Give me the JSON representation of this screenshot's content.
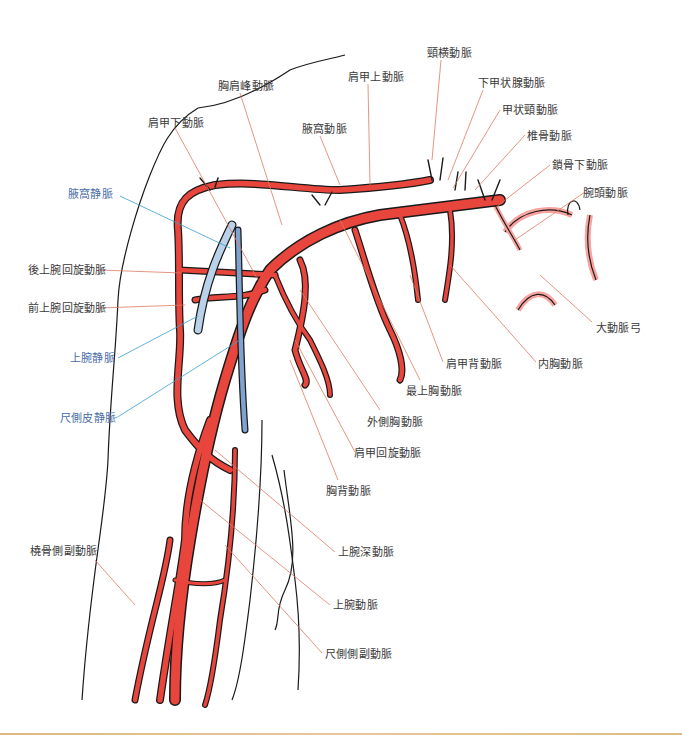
{
  "colors": {
    "artery": "#e8453c",
    "artery_highlight": "#f7a3a0",
    "vein": "#9fbfe0",
    "vein_dark": "#5b83b8",
    "outline": "#1a1a1a",
    "artery_leader": "#e07a62",
    "vein_leader": "#3aa0d0",
    "artery_label": "#3a3a3a",
    "vein_label": "#4a6ea8",
    "bottom_rule": "#dcc08f"
  },
  "labels": {
    "artery_left": [
      {
        "id": "posterior-circumflex-humeral",
        "text": "後上腕回旋動脈",
        "x": 28,
        "y": 264
      },
      {
        "id": "anterior-circumflex-humeral",
        "text": "前上腕回旋動脈",
        "x": 28,
        "y": 302
      },
      {
        "id": "radial-collateral",
        "text": "橈骨側副動脈",
        "x": 30,
        "y": 545
      }
    ],
    "vein_left": [
      {
        "id": "axillary-vein",
        "text": "腋窩静脈",
        "x": 68,
        "y": 188
      },
      {
        "id": "basilic-vein-upper",
        "text": "上腕静脈",
        "x": 70,
        "y": 352
      },
      {
        "id": "basilic-vein",
        "text": "尺側皮静脈",
        "x": 60,
        "y": 412
      }
    ],
    "artery_top": [
      {
        "id": "subscapular",
        "text": "肩甲下動脈",
        "x": 148,
        "y": 117
      },
      {
        "id": "thoracoacromial",
        "text": "胸肩峰動脈",
        "x": 218,
        "y": 80
      },
      {
        "id": "axillary-artery",
        "text": "腋窩動脈",
        "x": 302,
        "y": 123
      },
      {
        "id": "suprascapular",
        "text": "肩甲上動脈",
        "x": 348,
        "y": 71
      },
      {
        "id": "transverse-cervical",
        "text": "頸横動脈",
        "x": 427,
        "y": 47
      },
      {
        "id": "inferior-thyroid",
        "text": "下甲状腺動脈",
        "x": 478,
        "y": 77
      },
      {
        "id": "thyrocervical-trunk",
        "text": "甲状頸動脈",
        "x": 502,
        "y": 104
      },
      {
        "id": "vertebral",
        "text": "椎骨動脈",
        "x": 527,
        "y": 130
      },
      {
        "id": "subclavian",
        "text": "鎖骨下動脈",
        "x": 552,
        "y": 159
      },
      {
        "id": "brachiocephalic",
        "text": "腕頭動脈",
        "x": 583,
        "y": 187
      }
    ],
    "artery_right": [
      {
        "id": "aortic-arch",
        "text": "大動脈弓",
        "x": 596,
        "y": 322
      },
      {
        "id": "internal-thoracic",
        "text": "内胸動脈",
        "x": 538,
        "y": 358
      },
      {
        "id": "dorsal-scapular",
        "text": "肩甲背動脈",
        "x": 446,
        "y": 358
      },
      {
        "id": "superior-thoracic",
        "text": "最上胸動脈",
        "x": 406,
        "y": 385
      },
      {
        "id": "lateral-thoracic",
        "text": "外側胸動脈",
        "x": 367,
        "y": 416
      },
      {
        "id": "circumflex-scapular",
        "text": "肩甲回旋動脈",
        "x": 354,
        "y": 447
      },
      {
        "id": "thoracodorsal",
        "text": "胸背動脈",
        "x": 326,
        "y": 485
      },
      {
        "id": "deep-brachial",
        "text": "上腕深動脈",
        "x": 338,
        "y": 546
      },
      {
        "id": "brachial",
        "text": "上腕動脈",
        "x": 333,
        "y": 599
      },
      {
        "id": "ulnar-collateral",
        "text": "尺側側副動脈",
        "x": 325,
        "y": 648
      }
    ]
  }
}
